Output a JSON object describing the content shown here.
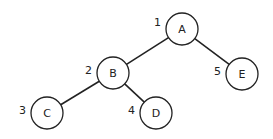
{
  "diagram": {
    "type": "binary-tree",
    "nodes": [
      {
        "id": "A",
        "label": "A",
        "order": "1",
        "cx": 182,
        "cy": 29
      },
      {
        "id": "B",
        "label": "B",
        "order": "2",
        "cx": 113,
        "cy": 73
      },
      {
        "id": "C",
        "label": "C",
        "order": "3",
        "cx": 47,
        "cy": 113
      },
      {
        "id": "D",
        "label": "D",
        "order": "4",
        "cx": 156,
        "cy": 113
      },
      {
        "id": "E",
        "label": "E",
        "order": "5",
        "cx": 242,
        "cy": 74
      }
    ],
    "edges": [
      {
        "from": "A",
        "to": "B"
      },
      {
        "from": "A",
        "to": "E"
      },
      {
        "from": "B",
        "to": "C"
      },
      {
        "from": "B",
        "to": "D"
      }
    ],
    "node_radius": 16,
    "colors": {
      "stroke": "#222222",
      "fill": "#ffffff"
    }
  }
}
